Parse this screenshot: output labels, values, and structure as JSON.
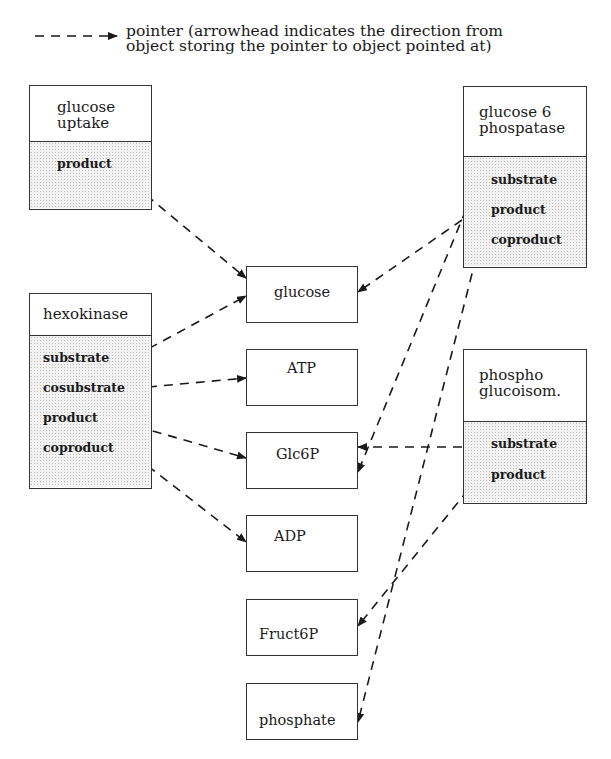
{
  "legend": {
    "symbol": "dashed-arrow",
    "line1": "pointer (arrowhead indicates the direction from",
    "line2": "object storing the pointer to object pointed at)"
  },
  "objects": {
    "glucose_uptake": {
      "title_line1": "glucose",
      "title_line2": "uptake",
      "attributes": [
        "product"
      ]
    },
    "hexokinase": {
      "title": "hexokinase",
      "attributes": [
        "substrate",
        "cosubstrate",
        "product",
        "coproduct"
      ]
    },
    "glucose6_phosphatase": {
      "title_line1": "glucose 6",
      "title_line2": "phospatase",
      "attributes": [
        "substrate",
        "product",
        "coproduct"
      ]
    },
    "phospho_glucoisom": {
      "title_line1": "phospho",
      "title_line2": "glucoisom.",
      "attributes": [
        "substrate",
        "product"
      ]
    }
  },
  "entities": [
    "glucose",
    "ATP",
    "Glc6P",
    "ADP",
    "Fruct6P",
    "phosphate"
  ],
  "pointers": [
    {
      "from": "glucose uptake.product",
      "to": "glucose"
    },
    {
      "from": "hexokinase.substrate",
      "to": "glucose"
    },
    {
      "from": "hexokinase.cosubstrate",
      "to": "ATP"
    },
    {
      "from": "hexokinase.product",
      "to": "Glc6P"
    },
    {
      "from": "hexokinase.coproduct",
      "to": "ADP"
    },
    {
      "from": "glucose 6 phospatase.substrate",
      "to": "Glc6P"
    },
    {
      "from": "glucose 6 phospatase.product",
      "to": "glucose"
    },
    {
      "from": "glucose 6 phospatase.coproduct",
      "to": "phosphate"
    },
    {
      "from": "phospho glucoisom.substrate",
      "to": "Glc6P"
    },
    {
      "from": "phospho glucoisom.product",
      "to": "Fruct6P"
    }
  ],
  "colors": {
    "line": "#1a1a1a",
    "border": "#333333",
    "stipple_bg": "#f2f2f2"
  }
}
